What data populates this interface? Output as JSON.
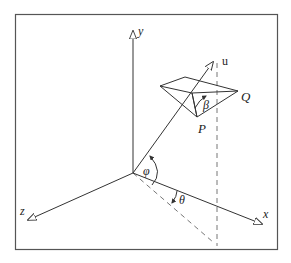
{
  "diagram": {
    "title": "",
    "axes": {
      "y": {
        "label": "y"
      },
      "x": {
        "label": "x"
      },
      "z": {
        "label": "z"
      }
    },
    "vector": {
      "label": "u"
    },
    "points": {
      "P": {
        "label": "P"
      },
      "Q": {
        "label": "Q"
      }
    },
    "angles": {
      "phi": {
        "label": "φ"
      },
      "theta": {
        "label": "θ"
      },
      "beta": {
        "label": "β"
      }
    },
    "colors": {
      "stroke": "#333333",
      "frame": "#555555",
      "background": "#ffffff"
    }
  }
}
